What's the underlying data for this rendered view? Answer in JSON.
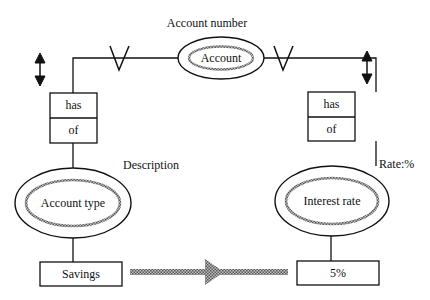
{
  "diagram": {
    "top_entity": {
      "label": "Account",
      "attribute_label": "Account number"
    },
    "left_relationship": {
      "upper": "has",
      "lower": "of"
    },
    "right_relationship": {
      "upper": "has",
      "lower": "of"
    },
    "left_entity": {
      "label": "Account type",
      "attribute_label": "Description",
      "value": "Savings"
    },
    "right_entity": {
      "label": "Interest rate",
      "attribute_label": "Rate:%",
      "value": "5%"
    },
    "colors": {
      "line": "#111111",
      "hatch": "#8a8a8a",
      "background": "#ffffff"
    }
  }
}
